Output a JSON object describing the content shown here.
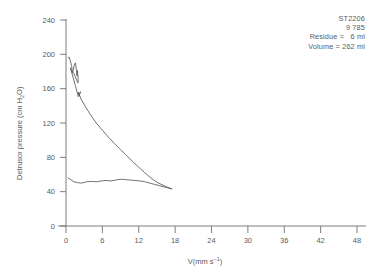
{
  "chart_data": {
    "type": "line",
    "title": "",
    "xlabel": "V(mm s⁻¹)",
    "ylabel": "Detrusor pressure (cm H₂O)",
    "xlim": [
      0,
      50
    ],
    "ylim": [
      0,
      250
    ],
    "xticks": [
      0,
      6,
      12,
      18,
      24,
      30,
      36,
      42,
      48
    ],
    "yticks": [
      0,
      40,
      80,
      120,
      160,
      200,
      240
    ],
    "grid": false,
    "legend": null,
    "series": [
      {
        "name": "detrusor-pressure-descending-limb",
        "points": [
          [
            0.35,
            196.0
          ],
          [
            0.55,
            196.5
          ],
          [
            0.75,
            191.0
          ],
          [
            0.95,
            186.0
          ],
          [
            1.05,
            178.5
          ],
          [
            1.2,
            181.0
          ],
          [
            1.35,
            187.5
          ],
          [
            1.55,
            190.0
          ],
          [
            1.7,
            183.0
          ],
          [
            1.8,
            175.0
          ],
          [
            1.9,
            181.0
          ],
          [
            2.0,
            172.0
          ],
          [
            2.0,
            166.5
          ],
          [
            1.75,
            170.0
          ],
          [
            1.35,
            177.0
          ],
          [
            1.0,
            180.5
          ],
          [
            0.8,
            183.0
          ],
          [
            0.72,
            184.5
          ],
          [
            1.55,
            163.5
          ],
          [
            1.8,
            157.0
          ],
          [
            2.05,
            150.5
          ],
          [
            2.4,
            156.5
          ],
          [
            2.15,
            152.0
          ],
          [
            2.0,
            156.0
          ],
          [
            2.55,
            147.0
          ],
          [
            3.2,
            139.0
          ],
          [
            4.0,
            130.0
          ],
          [
            5.0,
            120.0
          ],
          [
            6.0,
            111.5
          ],
          [
            7.0,
            103.5
          ],
          [
            8.0,
            96.0
          ],
          [
            9.0,
            89.0
          ],
          [
            10.0,
            82.0
          ],
          [
            11.0,
            75.0
          ],
          [
            12.0,
            68.5
          ],
          [
            13.0,
            62.0
          ],
          [
            14.0,
            56.0
          ],
          [
            15.0,
            51.0
          ],
          [
            16.0,
            47.5
          ],
          [
            16.8,
            45.0
          ],
          [
            17.4,
            43.5
          ]
        ]
      },
      {
        "name": "detrusor-pressure-flat-limb",
        "points": [
          [
            0.35,
            56.0
          ],
          [
            0.8,
            54.0
          ],
          [
            1.3,
            51.5
          ],
          [
            1.9,
            50.5
          ],
          [
            2.6,
            50.0
          ],
          [
            3.4,
            51.5
          ],
          [
            4.2,
            52.0
          ],
          [
            5.0,
            51.5
          ],
          [
            5.8,
            52.5
          ],
          [
            6.6,
            53.0
          ],
          [
            7.4,
            52.5
          ],
          [
            8.2,
            53.5
          ],
          [
            9.0,
            54.5
          ],
          [
            9.8,
            54.0
          ],
          [
            10.6,
            53.5
          ],
          [
            11.4,
            53.0
          ],
          [
            12.2,
            52.5
          ],
          [
            13.0,
            51.5
          ],
          [
            13.8,
            50.0
          ],
          [
            14.6,
            48.5
          ],
          [
            15.4,
            47.0
          ],
          [
            16.2,
            45.5
          ],
          [
            17.0,
            44.0
          ],
          [
            17.45,
            43.2
          ]
        ]
      }
    ],
    "annotations": {
      "patient_id": "ST2206",
      "study_number": "9 785",
      "residue_label": "Residue =",
      "residue_value": "6 ml",
      "volume_label": "Volume =",
      "volume_value": "262 ml"
    }
  },
  "axes": {
    "x_title_prefix": "V(mm s",
    "x_title_exp": "−1",
    "x_title_suffix": ")",
    "y_title_prefix": "Detrusor pressure (cm H",
    "y_title_sub": "2",
    "y_title_suffix": "O)"
  },
  "style": {
    "line_color": "#585858",
    "axis_color": "#6e6e6e",
    "text_color": "#5a5a5a",
    "background": "#ffffff"
  }
}
